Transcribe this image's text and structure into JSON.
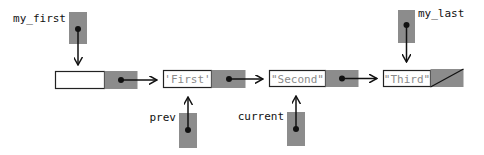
{
  "diagram": {
    "type": "linked-list",
    "colors": {
      "pointer_fill": "#8c8c8c",
      "box_stroke": "#222222",
      "text": "#111111",
      "value_text": "#8a8a8a"
    },
    "nodes": [
      {
        "id": "header",
        "value": ""
      },
      {
        "id": "n1",
        "value": "'First'"
      },
      {
        "id": "n2",
        "value": "\"Second\""
      },
      {
        "id": "n3",
        "value": "\"Third\"",
        "next": "null"
      }
    ],
    "pointers": [
      {
        "id": "my_first",
        "label": "my_first",
        "target": "header"
      },
      {
        "id": "my_last",
        "label": "my_last",
        "target": "n3"
      },
      {
        "id": "prev",
        "label": "prev",
        "target": "n1"
      },
      {
        "id": "current",
        "label": "current",
        "target": "n2"
      }
    ]
  }
}
